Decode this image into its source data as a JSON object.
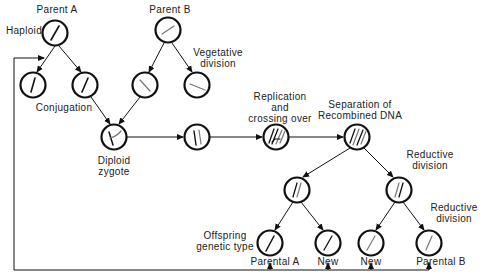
{
  "diagram": {
    "type": "life-cycle flow diagram",
    "labels": {
      "parent_a": "Parent A",
      "parent_b": "Parent B",
      "haploid": "Haploid",
      "vegetative_division_1": "Vegetative",
      "vegetative_division_2": "division",
      "conjugation": "Conjugation",
      "diploid_zygote_1": "Diploid",
      "diploid_zygote_2": "zygote",
      "replication_1": "Replication",
      "replication_2": "and",
      "replication_3": "crossing over",
      "separation_1": "Separation of",
      "separation_2": "Recombined DNA",
      "reductive_division_a_1": "Reductive",
      "reductive_division_a_2": "division",
      "reductive_division_b_1": "Reductive",
      "reductive_division_b_2": "division",
      "offspring_1": "Offspring",
      "offspring_2": "genetic type",
      "offspring_parental_a": "Parental A",
      "offspring_new_1": "New",
      "offspring_new_2": "New",
      "offspring_parental_b": "Parental B"
    },
    "nodes": [
      {
        "id": "parent-a",
        "content": "haploid cell, dark chromosome"
      },
      {
        "id": "parent-b",
        "content": "haploid cell, light chromosome"
      },
      {
        "id": "a-daughter-1",
        "content": "haploid cell"
      },
      {
        "id": "a-daughter-2",
        "content": "haploid cell"
      },
      {
        "id": "b-daughter-1",
        "content": "haploid cell"
      },
      {
        "id": "b-daughter-2",
        "content": "haploid cell"
      },
      {
        "id": "diploid-zygote",
        "content": "two chromosomes"
      },
      {
        "id": "paired-chromosomes",
        "content": "two chromosomes aligned"
      },
      {
        "id": "replication-crossing",
        "content": "four strands with crossover"
      },
      {
        "id": "separation",
        "content": "four recombined strands"
      },
      {
        "id": "reductive-1",
        "content": "two strands"
      },
      {
        "id": "reductive-2",
        "content": "two strands"
      },
      {
        "id": "offspring-parental-a",
        "content": "one strand"
      },
      {
        "id": "offspring-new-1",
        "content": "one strand"
      },
      {
        "id": "offspring-new-2",
        "content": "one strand"
      },
      {
        "id": "offspring-parental-b",
        "content": "one strand"
      }
    ],
    "colors": {
      "stroke": "#111111",
      "text": "#222222",
      "background": "#ffffff"
    }
  }
}
